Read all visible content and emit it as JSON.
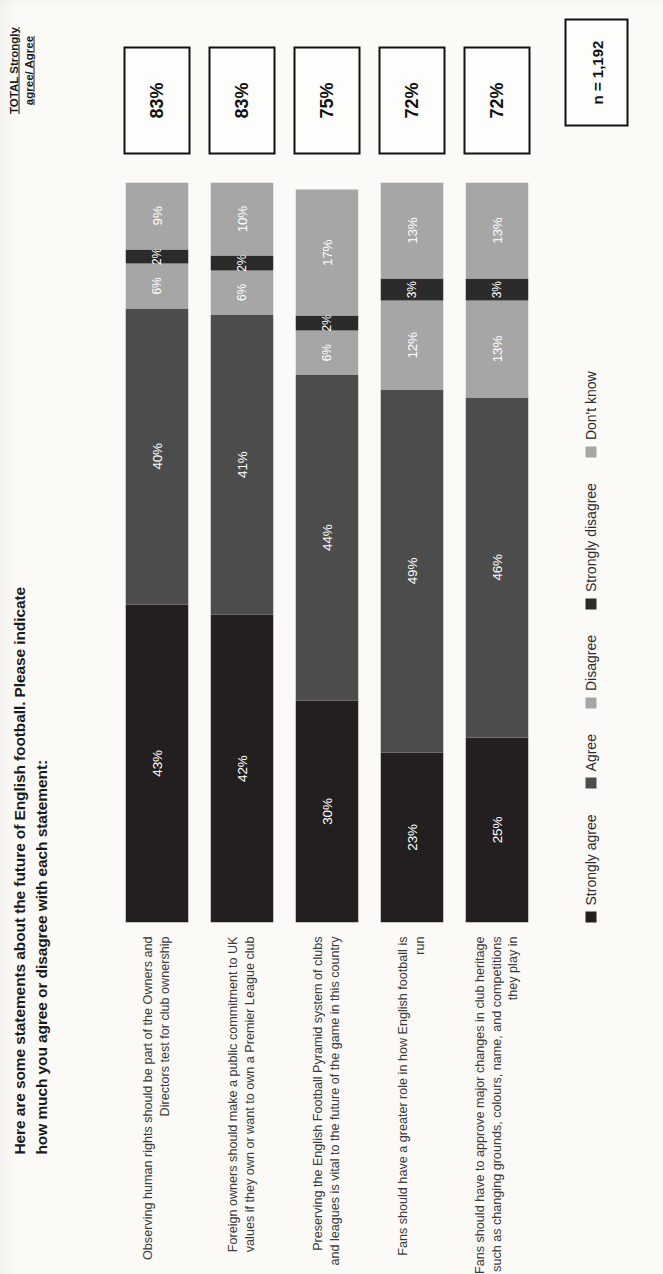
{
  "title": "Here are some statements about the future of English football.  Please indicate how much you agree or disagree with each statement:",
  "total_header": "TOTAL Strongly agree/ Agree",
  "sample_size": "n = 1,192",
  "colors": {
    "strongly_agree": "#231f20",
    "agree": "#4c4c4c",
    "disagree": "#a6a6a6",
    "strongly_disagree": "#2b2b2b",
    "dont_know": "#a6a6a6",
    "box_border": "#111111",
    "label_text": "#3a3a3a"
  },
  "legend": [
    {
      "label": "Strongly agree",
      "color": "#231f20"
    },
    {
      "label": "Agree",
      "color": "#4c4c4c"
    },
    {
      "label": "Disagree",
      "color": "#a6a6a6"
    },
    {
      "label": "Strongly disagree",
      "color": "#2b2b2b"
    },
    {
      "label": "Don't know",
      "color": "#a6a6a6"
    }
  ],
  "chart_data": {
    "type": "bar",
    "subtype": "stacked-horizontal-100pct",
    "title": "Here are some statements about the future of English football.  Please indicate how much you agree or disagree with each statement:",
    "xlabel": "",
    "ylabel": "",
    "xlim": [
      0,
      100
    ],
    "grid": false,
    "legend_position": "bottom",
    "value_suffix": "%",
    "categories": [
      "Observing human rights should be part of the Owners and Directors test for club ownership",
      "Foreign owners should make a public commitment to UK values if they own or want to own a Premier League club",
      "Preserving the English Football Pyramid system of clubs and leagues is vital to the future of the game in this country",
      "Fans should have a greater role in how English football is run",
      "Fans should have to approve major changes in club heritage such as changing grounds, colours, name, and competitions they play in"
    ],
    "series": [
      {
        "name": "Strongly agree",
        "color": "#231f20",
        "values": [
          43,
          42,
          30,
          23,
          25
        ]
      },
      {
        "name": "Agree",
        "color": "#4c4c4c",
        "values": [
          40,
          41,
          44,
          49,
          46
        ]
      },
      {
        "name": "Disagree",
        "color": "#a6a6a6",
        "values": [
          6,
          6,
          6,
          12,
          13
        ]
      },
      {
        "name": "Strongly disagree",
        "color": "#2b2b2b",
        "values": [
          2,
          2,
          2,
          3,
          3
        ]
      },
      {
        "name": "Don't know",
        "color": "#a6a6a6",
        "values": [
          9,
          10,
          17,
          13,
          13
        ]
      }
    ],
    "totals": [
      83,
      83,
      75,
      72,
      72
    ],
    "annotation": "n = 1,192"
  },
  "rows": [
    {
      "label": "Observing human rights should be part of the Owners and Directors test for club ownership",
      "total": "83%",
      "segments": [
        {
          "name": "Strongly agree",
          "label": "43%",
          "value": 43,
          "color": "#231f20"
        },
        {
          "name": "Agree",
          "label": "40%",
          "value": 40,
          "color": "#4c4c4c"
        },
        {
          "name": "Disagree",
          "label": "6%",
          "value": 6,
          "color": "#a6a6a6"
        },
        {
          "name": "Strongly disagree",
          "label": "2%",
          "value": 2,
          "color": "#2b2b2b"
        },
        {
          "name": "Don't know",
          "label": "9%",
          "value": 9,
          "color": "#a6a6a6"
        }
      ]
    },
    {
      "label": "Foreign owners should make a public commitment to UK values if they own or want to own a Premier League club",
      "total": "83%",
      "segments": [
        {
          "name": "Strongly agree",
          "label": "42%",
          "value": 42,
          "color": "#231f20"
        },
        {
          "name": "Agree",
          "label": "41%",
          "value": 41,
          "color": "#4c4c4c"
        },
        {
          "name": "Disagree",
          "label": "6%",
          "value": 6,
          "color": "#a6a6a6"
        },
        {
          "name": "Strongly disagree",
          "label": "2%",
          "value": 2,
          "color": "#2b2b2b"
        },
        {
          "name": "Don't know",
          "label": "10%",
          "value": 10,
          "color": "#a6a6a6"
        }
      ]
    },
    {
      "label": "Preserving the English Football Pyramid system of clubs and leagues is vital to the future of the game in this country",
      "total": "75%",
      "segments": [
        {
          "name": "Strongly agree",
          "label": "30%",
          "value": 30,
          "color": "#231f20"
        },
        {
          "name": "Agree",
          "label": "44%",
          "value": 44,
          "color": "#4c4c4c"
        },
        {
          "name": "Disagree",
          "label": "6%",
          "value": 6,
          "color": "#a6a6a6"
        },
        {
          "name": "Strongly disagree",
          "label": "2%",
          "value": 2,
          "color": "#2b2b2b"
        },
        {
          "name": "Don't know",
          "label": "17%",
          "value": 17,
          "color": "#a6a6a6"
        }
      ]
    },
    {
      "label": "Fans should have a greater role in how English football is run",
      "total": "72%",
      "segments": [
        {
          "name": "Strongly agree",
          "label": "23%",
          "value": 23,
          "color": "#231f20"
        },
        {
          "name": "Agree",
          "label": "49%",
          "value": 49,
          "color": "#4c4c4c"
        },
        {
          "name": "Disagree",
          "label": "12%",
          "value": 12,
          "color": "#a6a6a6"
        },
        {
          "name": "Strongly disagree",
          "label": "3%",
          "value": 3,
          "color": "#2b2b2b"
        },
        {
          "name": "Don't know",
          "label": "13%",
          "value": 13,
          "color": "#a6a6a6"
        }
      ]
    },
    {
      "label": "Fans should have to approve major changes in club heritage such as changing grounds, colours, name, and competitions they play in",
      "total": "72%",
      "segments": [
        {
          "name": "Strongly agree",
          "label": "25%",
          "value": 25,
          "color": "#231f20"
        },
        {
          "name": "Agree",
          "label": "46%",
          "value": 46,
          "color": "#4c4c4c"
        },
        {
          "name": "Disagree",
          "label": "13%",
          "value": 13,
          "color": "#a6a6a6"
        },
        {
          "name": "Strongly disagree",
          "label": "3%",
          "value": 3,
          "color": "#2b2b2b"
        },
        {
          "name": "Don't know",
          "label": "13%",
          "value": 13,
          "color": "#a6a6a6"
        }
      ]
    }
  ]
}
